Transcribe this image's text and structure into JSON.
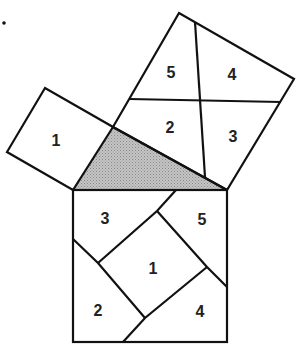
{
  "triangle": {
    "fill": "#b8b8b8",
    "vertices": [
      [
        73,
        190
      ],
      [
        227,
        190
      ],
      [
        113,
        127
      ]
    ]
  },
  "small_square": {
    "label": "1",
    "vertices": [
      [
        45,
        88
      ],
      [
        7,
        152
      ],
      [
        73,
        190
      ],
      [
        113,
        127
      ]
    ]
  },
  "medium_square": {
    "vertices": [
      [
        113,
        127
      ],
      [
        179,
        13
      ],
      [
        294,
        79
      ],
      [
        227,
        190
      ]
    ],
    "pieces": [
      {
        "id": "5",
        "label": "5"
      },
      {
        "id": "4",
        "label": "4"
      },
      {
        "id": "2",
        "label": "2"
      },
      {
        "id": "3",
        "label": "3"
      }
    ]
  },
  "hypotenuse_square": {
    "vertices": [
      [
        73,
        190
      ],
      [
        227,
        190
      ],
      [
        227,
        342
      ],
      [
        73,
        342
      ]
    ],
    "pieces": [
      {
        "id": "3",
        "label": "3"
      },
      {
        "id": "5",
        "label": "5"
      },
      {
        "id": "1",
        "label": "1"
      },
      {
        "id": "2",
        "label": "2"
      },
      {
        "id": "4",
        "label": "4"
      }
    ]
  },
  "marker": "•"
}
